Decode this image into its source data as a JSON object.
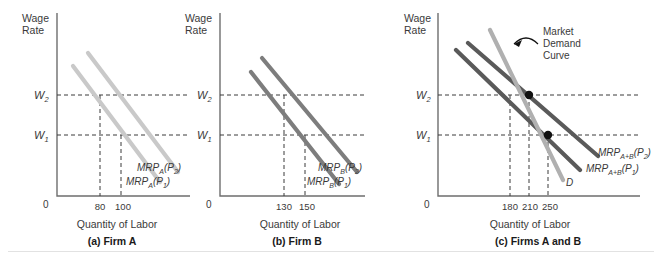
{
  "figure": {
    "axis_titles": {
      "y": [
        "Wage",
        "Rate"
      ],
      "x": "Quantity of Labor"
    },
    "origin_label": "0",
    "wage_labels": {
      "w1_base": "W",
      "w1_sub": "1",
      "w2_base": "W",
      "w2_sub": "2"
    },
    "colors": {
      "panel_a_curve": "#c9c9c9",
      "panel_b_curve": "#7d7d7d",
      "panel_c_mrp": "#5a5a5a",
      "panel_c_market": "#b0b0b0",
      "axis": "#6e6e6e",
      "dash": "#3a3a3a",
      "dot": "#111111",
      "text": "#3a3a3a"
    },
    "panels": [
      {
        "id": "a",
        "caption": "(a) Firm A",
        "y_axis_title": [
          "Wage",
          "Rate"
        ],
        "x_axis_title": "Quantity of Labor",
        "origin": "0",
        "x_ticks": [
          {
            "label": "80",
            "value": 80
          },
          {
            "label": "100",
            "value": 100
          }
        ],
        "y_ticks": [
          {
            "label": "W",
            "sub": "1"
          },
          {
            "label": "W",
            "sub": "2"
          }
        ],
        "curves": [
          {
            "name": "MRP_A(P2)",
            "base": "MRP",
            "sub": "A",
            "paren": "(P",
            "paren_sub": "2",
            "paren_end": ")"
          },
          {
            "name": "MRP_A(P1)",
            "base": "MRP",
            "sub": "A",
            "paren": "(P",
            "paren_sub": "1",
            "paren_end": ")"
          }
        ]
      },
      {
        "id": "b",
        "caption": "(b) Firm B",
        "y_axis_title": [
          "Wage",
          "Rate"
        ],
        "x_axis_title": "Quantity of Labor",
        "origin": "0",
        "x_ticks": [
          {
            "label": "130",
            "value": 130
          },
          {
            "label": "150",
            "value": 150
          }
        ],
        "y_ticks": [
          {
            "label": "W",
            "sub": "1"
          },
          {
            "label": "W",
            "sub": "2"
          }
        ],
        "curves": [
          {
            "name": "MRP_B(P2)",
            "base": "MRP",
            "sub": "B",
            "paren": "(P",
            "paren_sub": "2",
            "paren_end": ")"
          },
          {
            "name": "MRP_B(P1)",
            "base": "MRP",
            "sub": "B",
            "paren": "(P",
            "paren_sub": "1",
            "paren_end": ")"
          }
        ]
      },
      {
        "id": "c",
        "caption": "(c) Firms A and B",
        "y_axis_title": [
          "Wage",
          "Rate"
        ],
        "x_axis_title": "Quantity of Labor",
        "origin": "0",
        "x_ticks": [
          {
            "label": "180",
            "value": 180
          },
          {
            "label": "210",
            "value": 210
          },
          {
            "label": "250",
            "value": 250
          }
        ],
        "y_ticks": [
          {
            "label": "W",
            "sub": "1"
          },
          {
            "label": "W",
            "sub": "2"
          }
        ],
        "annotation": [
          "Market",
          "Demand",
          "Curve"
        ],
        "curves": [
          {
            "name": "MRP_A+B(P2)",
            "base": "MRP",
            "sub": "A+B",
            "paren": "(P",
            "paren_sub": "2",
            "paren_end": ")"
          },
          {
            "name": "MRP_A+B(P1)",
            "base": "MRP",
            "sub": "A+B",
            "paren": "(P",
            "paren_sub": "1",
            "paren_end": ")"
          },
          {
            "name": "D",
            "base": "D",
            "sub": "",
            "paren": "",
            "paren_sub": "",
            "paren_end": ""
          }
        ],
        "equilibrium_points": [
          {
            "label": "W2 at 210",
            "wage": "W2",
            "quantity": 210
          },
          {
            "label": "W1 at 250",
            "wage": "W1",
            "quantity": 250
          }
        ]
      }
    ]
  }
}
